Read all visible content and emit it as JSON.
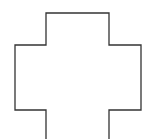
{
  "diagram": {
    "shape": "cross-outline",
    "stroke_color": "#333333",
    "stroke_width": 1.3,
    "background": "#ffffff",
    "outline_points": [
      [
        46,
        139
      ],
      [
        46,
        110
      ],
      [
        15,
        110
      ],
      [
        15,
        45
      ],
      [
        46,
        45
      ],
      [
        46,
        13
      ],
      [
        109,
        13
      ],
      [
        109,
        45
      ],
      [
        141,
        45
      ],
      [
        141,
        110
      ],
      [
        109,
        110
      ],
      [
        109,
        139
      ]
    ]
  }
}
